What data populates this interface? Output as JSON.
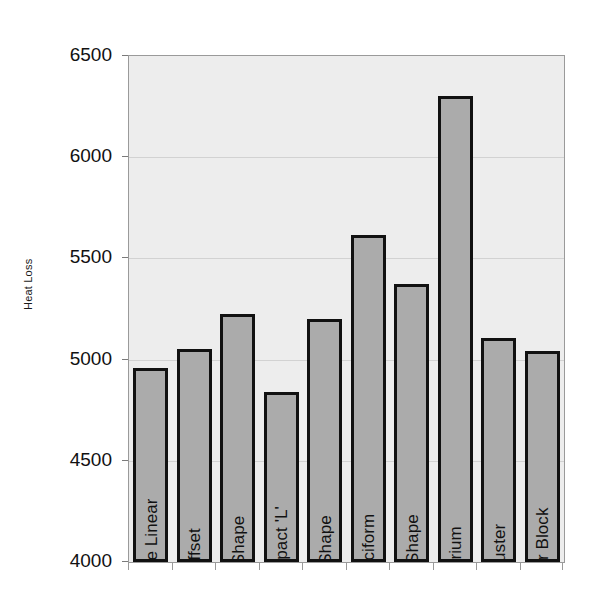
{
  "chart_data": {
    "type": "bar",
    "title": "",
    "xlabel": "",
    "ylabel": "Heat Loss",
    "ylim": [
      4000,
      6500
    ],
    "ytick_step": 500,
    "yticks": [
      4000,
      4500,
      5000,
      5500,
      6000,
      6500
    ],
    "ytick_labels": [
      "4000",
      "4500",
      "5000",
      "5500",
      "6000",
      "6500"
    ],
    "grid": true,
    "legend": "none",
    "labels_inside_bars": true,
    "label_rotation_degrees": 90,
    "categories": [
      "Simple Linear",
      "Offset",
      "'L' Shape",
      "Compact 'L'",
      "'T' Shape",
      "Cruciform",
      "'U' Shape",
      "Atrium",
      "Cluster",
      "Poinr Block"
    ],
    "values": [
      4960,
      5050,
      5225,
      4840,
      5200,
      5615,
      5375,
      6300,
      5105,
      5045
    ],
    "series": [
      {
        "name": "Heat Loss",
        "values": [
          4960,
          5050,
          5225,
          4840,
          5200,
          5615,
          5375,
          6300,
          5105,
          5045
        ]
      }
    ]
  },
  "style": {
    "bar_fill": "#ababab",
    "bar_border": "#111111",
    "plot_background": "#ededed",
    "gridline_color": "#d2d2d2",
    "axis_color": "#9a9a9a",
    "text_color": "#111111",
    "figure_background": "#ffffff"
  }
}
